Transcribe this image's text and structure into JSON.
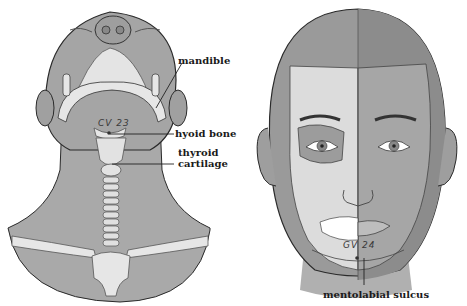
{
  "figure": {
    "left_panel": {
      "view": "inferior view of head and neck",
      "acupoint": "CV 23",
      "labels": {
        "mandible": "mandible",
        "hyoid_bone": "hyoid bone",
        "thyroid_cartilage_line1": "thyroid",
        "thyroid_cartilage_line2": "cartilage"
      }
    },
    "right_panel": {
      "view": "frontal view of face, half skull",
      "acupoint": "GV 24",
      "labels": {
        "mentolabial_sulcus": "mentolabial sulcus"
      }
    },
    "colors": {
      "skin_light": "#a8a8a8",
      "skin_dark": "#8f8f8f",
      "bone": "#e6e6e6",
      "outline": "#2a2a2a",
      "background": "#ffffff"
    }
  }
}
